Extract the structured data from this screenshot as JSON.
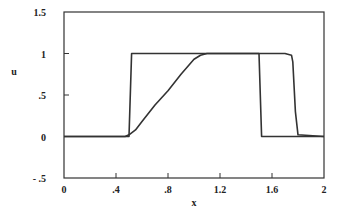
{
  "chart_data": {
    "type": "line",
    "title": "",
    "xlabel": "x",
    "ylabel": "u",
    "xlim": [
      0,
      2
    ],
    "ylim": [
      -0.5,
      1.5
    ],
    "grid": false,
    "legend": null,
    "x_ticks": [
      "0",
      ".4",
      ".8",
      "1.2",
      "1.6",
      "2"
    ],
    "y_ticks": [
      "1.5",
      "1",
      ".5",
      "0",
      "- .5"
    ],
    "series": [
      {
        "name": "initial square pulse",
        "x": [
          0,
          0.5,
          0.52,
          1.5,
          1.52,
          2
        ],
        "y": [
          0,
          0,
          1,
          1,
          0,
          0
        ]
      },
      {
        "name": "computed solution",
        "x": [
          0,
          0.47,
          0.5,
          0.55,
          0.6,
          0.7,
          0.8,
          0.9,
          1.0,
          1.05,
          1.1,
          1.7,
          1.75,
          1.76,
          1.78,
          1.8,
          2
        ],
        "y": [
          0,
          0,
          0.02,
          0.08,
          0.18,
          0.38,
          0.55,
          0.75,
          0.93,
          0.98,
          1.0,
          1.0,
          0.98,
          0.9,
          0.3,
          0.02,
          0
        ]
      }
    ]
  },
  "labels": {
    "xlabel": "x",
    "ylabel": "u",
    "x_ticks": [
      "0",
      ".4",
      ".8",
      "1.2",
      "1.6",
      "2"
    ],
    "y_ticks": [
      "1.5",
      "1",
      ".5",
      "0",
      "- .5"
    ]
  }
}
